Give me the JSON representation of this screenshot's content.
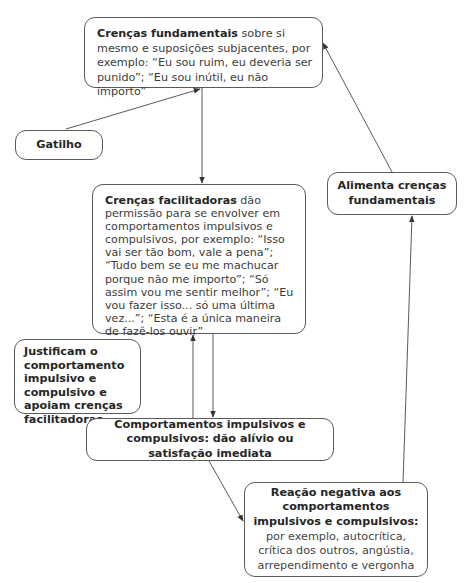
{
  "diagram": {
    "nodes": {
      "core_beliefs": {
        "title": "Crenças fundamentais",
        "text_line1_rest": " sobre si mesmo e",
        "text_rest": "suposições subjacentes, por exemplo: “Eu sou ruim, eu deveria ser punido”; “Eu sou inútil, eu não importo”"
      },
      "trigger": {
        "label": "Gatilho"
      },
      "facilitating_beliefs": {
        "title": "Crenças facilitadoras",
        "text": " dão permissão para se envolver em comportamentos impulsivos e compulsivos, por exemplo: “Isso vai ser tão bom, vale a pena”; “Tudo bem se eu me machucar porque não me importo”; “Só assim vou me sentir melhor”; “Eu vou fazer isso... só uma última vez...”; “Esta é a única maneira de fazê-los ouvir”"
      },
      "feeds_core": {
        "label": "Alimenta crenças fundamentais"
      },
      "justify": {
        "label": "Justificam o comportamento impulsivo e compulsivo e apoiam crenças facilitadoras"
      },
      "behaviors": {
        "label": "Comportamentos impulsivos e compulsivos: dão alívio ou satisfação imediata"
      },
      "negative_reaction": {
        "title": "Reação negativa aos comportamentos impulsivos e compulsivos:",
        "text": "por exemplo, autocrítica, crítica dos outros, angústia, arrependimento e vergonha"
      }
    },
    "edges": [
      {
        "from": "trigger",
        "to": "core_beliefs"
      },
      {
        "from": "core_beliefs",
        "to": "facilitating_beliefs"
      },
      {
        "from": "facilitating_beliefs",
        "to": "behaviors"
      },
      {
        "from": "behaviors",
        "to": "facilitating_beliefs"
      },
      {
        "from": "behaviors",
        "to": "negative_reaction"
      },
      {
        "from": "negative_reaction",
        "to": "feeds_core"
      },
      {
        "from": "feeds_core",
        "to": "core_beliefs"
      }
    ],
    "colors": {
      "line": "#5a5a5a",
      "text": "#3b3b3b",
      "background": "#ffffff"
    }
  }
}
